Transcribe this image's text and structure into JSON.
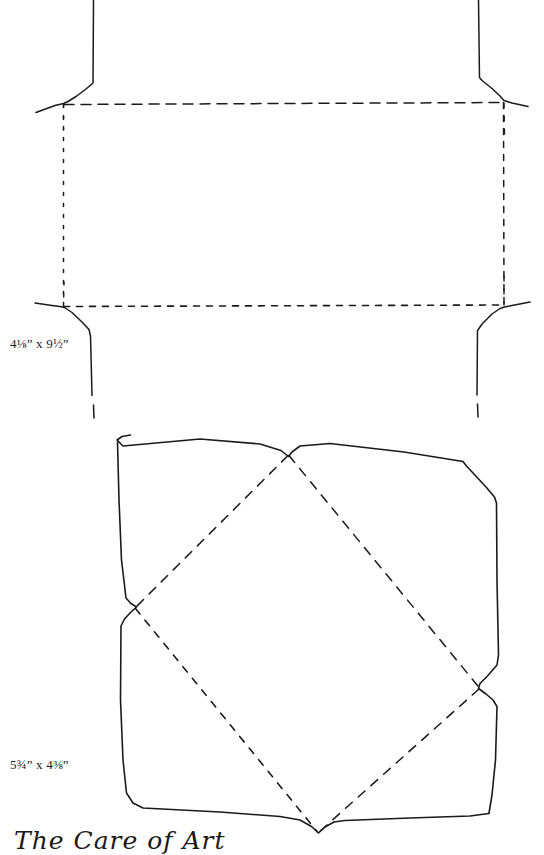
{
  "page": {
    "background_color": "#ffffff",
    "ink_color": "#1a1a1a",
    "width": 544,
    "height": 855
  },
  "figures": [
    {
      "id": "rectangular-envelope-template",
      "name": "Rectangular envelope folding template",
      "size_label": "4⅛” x 9½”",
      "fold_line_style": "dashed",
      "cut_line_style": "solid"
    },
    {
      "id": "square-envelope-template",
      "name": "Square envelope folding template with diamond fold",
      "size_label": "5¾” x 4⅜”",
      "fold_line_style": "dashed",
      "cut_line_style": "solid"
    }
  ],
  "labels": {
    "top_figure_dimensions": "4⅛” x 9½”",
    "bottom_figure_dimensions": "5¾” x 4⅜”"
  },
  "caption": {
    "text": "The Care of Art",
    "style": "handwritten-script-cropped"
  }
}
